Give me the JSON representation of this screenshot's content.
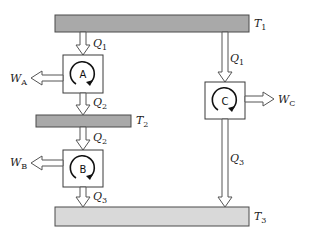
{
  "diagram": {
    "type": "heat-engine-cascade",
    "reservoirs": [
      {
        "id": "T1",
        "symbol": "T",
        "subscript": "1",
        "shade": "dark"
      },
      {
        "id": "T2",
        "symbol": "T",
        "subscript": "2",
        "shade": "dark"
      },
      {
        "id": "T3",
        "symbol": "T",
        "subscript": "3",
        "shade": "light"
      }
    ],
    "engines": [
      {
        "id": "A",
        "label": "A"
      },
      {
        "id": "B",
        "label": "B"
      },
      {
        "id": "C",
        "label": "C"
      }
    ],
    "heat_flows": [
      {
        "label_symbol": "Q",
        "label_subscript": "1",
        "from": "T1",
        "to": "A"
      },
      {
        "label_symbol": "Q",
        "label_subscript": "2",
        "from": "A",
        "to": "T2"
      },
      {
        "label_symbol": "Q",
        "label_subscript": "2",
        "from": "T2",
        "to": "B"
      },
      {
        "label_symbol": "Q",
        "label_subscript": "3",
        "from": "B",
        "to": "T3"
      },
      {
        "label_symbol": "Q",
        "label_subscript": "1",
        "from": "T1",
        "to": "C"
      },
      {
        "label_symbol": "Q",
        "label_subscript": "3",
        "from": "C",
        "to": "T3"
      }
    ],
    "work_outputs": [
      {
        "label_symbol": "W",
        "label_subscript": "A",
        "from": "A"
      },
      {
        "label_symbol": "W",
        "label_subscript": "B",
        "from": "B"
      },
      {
        "label_symbol": "W",
        "label_subscript": "C",
        "from": "C"
      }
    ]
  }
}
